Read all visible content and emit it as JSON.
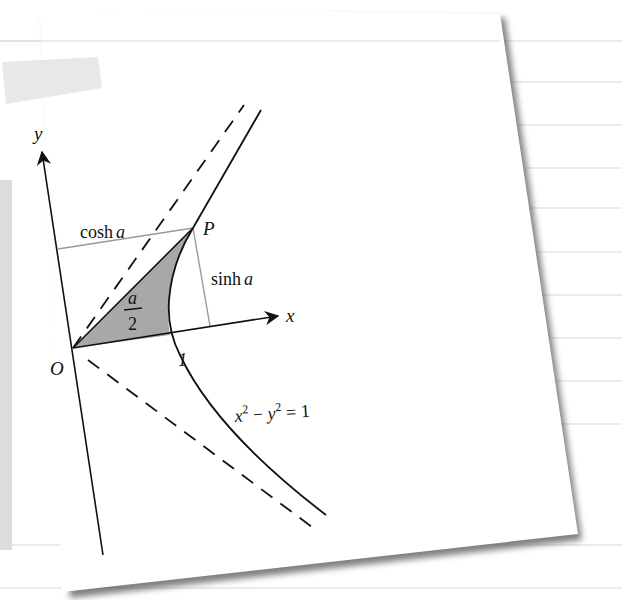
{
  "diagram": {
    "axes": {
      "x_label": "x",
      "y_label": "y",
      "origin_label": "O",
      "x_tick_label": "1"
    },
    "point_label": "P",
    "horizontal_segment_label": {
      "prefix": "cosh",
      "var": "a"
    },
    "vertical_segment_label": {
      "prefix": "sinh",
      "var": "a"
    },
    "area_label": {
      "numerator": "a",
      "denominator": "2"
    },
    "curve_equation": {
      "x": "x",
      "x_exp": "2",
      "minus": " − ",
      "y": "y",
      "y_exp": "2",
      "rhs": " = 1"
    },
    "asymptotes": "dashed lines y = ±x",
    "colors": {
      "paper": "#ffffff",
      "ink": "#111111",
      "shaded_region": "#a8a8a8",
      "projection_lines": "#9a9a9a",
      "paper_shadow": "#555555",
      "background_lines": "#d6d6d6",
      "tape": "#e6e6e6"
    }
  }
}
